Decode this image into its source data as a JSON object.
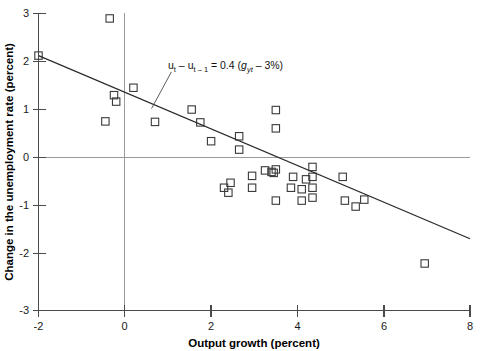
{
  "chart_data": {
    "type": "scatter",
    "title": "",
    "xlabel": "Output growth (percent)",
    "ylabel": "Change in the unemployment rate (percent)",
    "xlim": [
      -2,
      8
    ],
    "ylim": [
      -3,
      3
    ],
    "xticks": [
      "-2",
      "0",
      "2",
      "4",
      "6",
      "8"
    ],
    "xtick_values": [
      -2,
      0,
      2,
      4,
      6,
      8
    ],
    "yticks": [
      "3",
      "2",
      "1",
      "0",
      "-1",
      "-2",
      "-3"
    ],
    "ytick_values": [
      3,
      2,
      1,
      0,
      -1,
      -2,
      -3
    ],
    "grid": false,
    "reference_lines": [
      {
        "axis": "y",
        "value": 0,
        "color": "#9a9a9a"
      },
      {
        "axis": "x",
        "value": 0,
        "color": "#9a9a9a"
      }
    ],
    "legend": null,
    "marker": "open-square",
    "marker_color": "#3a3a3a",
    "points": [
      {
        "x": -2.0,
        "y": 2.15
      },
      {
        "x": -0.35,
        "y": 2.9
      },
      {
        "x": -0.25,
        "y": 1.35
      },
      {
        "x": -0.2,
        "y": 1.22
      },
      {
        "x": -0.45,
        "y": 0.82
      },
      {
        "x": 0.2,
        "y": 1.5
      },
      {
        "x": 0.7,
        "y": 0.81
      },
      {
        "x": 1.55,
        "y": 1.06
      },
      {
        "x": 1.75,
        "y": 0.8
      },
      {
        "x": 2.0,
        "y": 0.42
      },
      {
        "x": 2.65,
        "y": 0.52
      },
      {
        "x": 2.65,
        "y": 0.25
      },
      {
        "x": 3.5,
        "y": 1.05
      },
      {
        "x": 3.5,
        "y": 0.68
      },
      {
        "x": 2.45,
        "y": -0.42
      },
      {
        "x": 2.3,
        "y": -0.52
      },
      {
        "x": 2.4,
        "y": -0.62
      },
      {
        "x": 2.95,
        "y": -0.28
      },
      {
        "x": 2.95,
        "y": -0.52
      },
      {
        "x": 3.25,
        "y": -0.17
      },
      {
        "x": 3.4,
        "y": -0.2
      },
      {
        "x": 3.45,
        "y": -0.22
      },
      {
        "x": 3.5,
        "y": -0.15
      },
      {
        "x": 3.5,
        "y": -0.78
      },
      {
        "x": 3.9,
        "y": -0.3
      },
      {
        "x": 3.85,
        "y": -0.52
      },
      {
        "x": 4.1,
        "y": -0.55
      },
      {
        "x": 4.1,
        "y": -0.78
      },
      {
        "x": 4.2,
        "y": -0.35
      },
      {
        "x": 4.35,
        "y": -0.1
      },
      {
        "x": 4.35,
        "y": -0.3
      },
      {
        "x": 4.35,
        "y": -0.52
      },
      {
        "x": 4.35,
        "y": -0.72
      },
      {
        "x": 5.05,
        "y": -0.3
      },
      {
        "x": 5.1,
        "y": -0.78
      },
      {
        "x": 5.35,
        "y": -0.9
      },
      {
        "x": 5.55,
        "y": -0.76
      },
      {
        "x": 6.95,
        "y": -2.05
      }
    ],
    "fit_line": {
      "label": "u_t - u_{t-1} = 0.4 (g_yt - 3%)",
      "slope": -0.37,
      "intercept": 1.41,
      "x_start": -2.0,
      "y_start": 2.15,
      "x_end": 8.0,
      "y_end": -1.55
    },
    "annotation": {
      "lhs_u": "u",
      "lhs_sub1": "t",
      "minus": " – ",
      "lhs_u2": "u",
      "lhs_sub2": "t – 1",
      "equals": " = 0.4 (",
      "rhs_g": "g",
      "rhs_sub": "yt",
      "tail": " – 3%)",
      "plain": "u_t – u_t–1 = 0.4 (g_yt – 3%)",
      "leader_from": {
        "x": 1.08,
        "y": 1.82
      },
      "leader_to": {
        "x": 0.62,
        "y": 1.08
      }
    }
  }
}
